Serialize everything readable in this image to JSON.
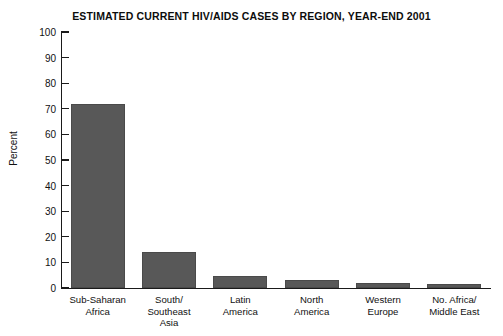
{
  "chart_data": {
    "type": "bar",
    "title": "ESTIMATED CURRENT HIV/AIDS CASES BY REGION, YEAR-END 2001",
    "xlabel": "",
    "ylabel": "Percent",
    "ylim": [
      0,
      100
    ],
    "yticks": [
      0,
      10,
      20,
      30,
      40,
      50,
      60,
      70,
      80,
      90,
      100
    ],
    "grid": false,
    "legend": false,
    "bar_color": "#585858",
    "categories": [
      "Sub-Saharan\nAfrica",
      "South/\nSoutheast\nAsia",
      "Latin\nAmerica",
      "North\nAmerica",
      "Western\nEurope",
      "No. Africa/\nMiddle East"
    ],
    "values": [
      72,
      14,
      4.5,
      3,
      2,
      1.5
    ]
  },
  "axis": {
    "y_title": "Percent",
    "y_tick_labels": [
      "100",
      "90",
      "80",
      "70",
      "60",
      "50",
      "40",
      "30",
      "20",
      "10",
      "0"
    ]
  },
  "categories": [
    {
      "lines": [
        "Sub-Saharan",
        "Africa"
      ],
      "value": 72
    },
    {
      "lines": [
        "South/",
        "Southeast",
        "Asia"
      ],
      "value": 14
    },
    {
      "lines": [
        "Latin",
        "America"
      ],
      "value": 4.5
    },
    {
      "lines": [
        "North",
        "America"
      ],
      "value": 3
    },
    {
      "lines": [
        "Western",
        "Europe"
      ],
      "value": 2
    },
    {
      "lines": [
        "No. Africa/",
        "Middle East"
      ],
      "value": 1.5
    }
  ]
}
